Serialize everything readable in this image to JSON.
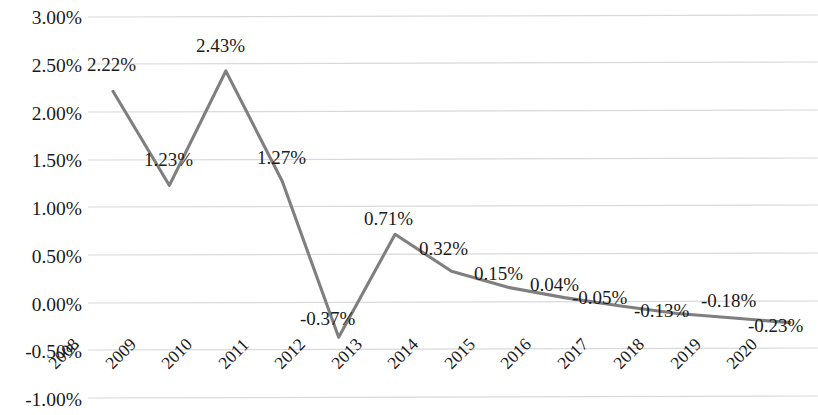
{
  "chart_data": {
    "type": "line",
    "title": "",
    "subtitle": "",
    "xlabel": "",
    "ylabel": "",
    "categories": [
      "2008",
      "2009",
      "2010",
      "2011",
      "2012",
      "2013",
      "2014",
      "2015",
      "2016",
      "2017",
      "2018",
      "2019",
      "2020"
    ],
    "values": [
      2.22,
      1.23,
      2.43,
      1.27,
      -0.37,
      0.71,
      0.32,
      0.15,
      0.04,
      -0.05,
      -0.13,
      -0.18,
      -0.23
    ],
    "point_labels": [
      "2.22%",
      "1.23%",
      "2.43%",
      "1.27%",
      "-0.37%",
      "0.71%",
      "0.32%",
      "0.15%",
      "0.04%",
      "-0.05%",
      "-0.13%",
      "-0.18%",
      "-0.23%"
    ],
    "series": [
      {
        "name": "",
        "values": [
          2.22,
          1.23,
          2.43,
          1.27,
          -0.37,
          0.71,
          0.32,
          0.15,
          0.04,
          -0.05,
          -0.13,
          -0.18,
          -0.23
        ],
        "color": "#7f7f7f"
      }
    ],
    "ylim": [
      -1.0,
      3.0
    ],
    "ytick_values": [
      3.0,
      2.5,
      2.0,
      1.5,
      1.0,
      0.5,
      0.0,
      -0.5,
      -1.0
    ],
    "ytick_labels": [
      "3.00%",
      "2.50%",
      "2.00%",
      "1.50%",
      "1.00%",
      "0.50%",
      "0.00%",
      "-0.50%",
      "-1.00%"
    ],
    "grid": true,
    "grid_color": "#d9d9d9",
    "legend": "none",
    "units": "percent",
    "line_color": "#7f7f7f",
    "text_color": "#1a1a1a",
    "background": "#ffffff",
    "xtick_rotation": -45
  }
}
